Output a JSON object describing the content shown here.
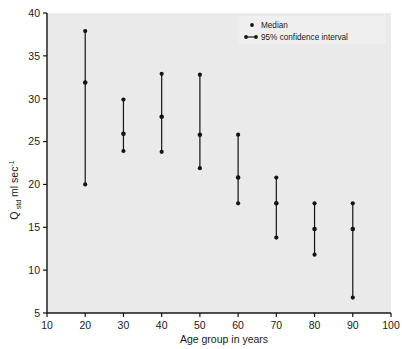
{
  "chart_data": {
    "type": "scatter",
    "title": "",
    "subtitle": "",
    "xlabel": "Age group in years",
    "ylabel": "Q̇std ml sec⁻¹",
    "ylabel_parts": {
      "main": "Q",
      "dot": "˙",
      "subscript": "std",
      "unit": " ml sec",
      "exponent": "-1"
    },
    "xlim": [
      10,
      100
    ],
    "ylim": [
      5,
      40
    ],
    "x_ticks": [
      10,
      20,
      30,
      40,
      50,
      60,
      70,
      80,
      90,
      100
    ],
    "y_ticks": [
      5,
      10,
      15,
      20,
      25,
      30,
      35,
      40
    ],
    "x_tick_labels": [
      "10",
      "20",
      "30",
      "40",
      "50",
      "60",
      "70",
      "80",
      "90",
      "100"
    ],
    "y_tick_labels": [
      "5",
      "10",
      "15",
      "20",
      "25",
      "30",
      "35",
      "40"
    ],
    "grid": false,
    "legend_position": "top-right",
    "legend": [
      {
        "label": "Median",
        "marker": "dot"
      },
      {
        "label": "95% confidence interval",
        "marker": "interval"
      }
    ],
    "categories": [
      20,
      30,
      40,
      50,
      60,
      70,
      80,
      90
    ],
    "series": [
      {
        "name": "Median",
        "values": [
          31.9,
          25.9,
          27.9,
          25.8,
          20.8,
          17.8,
          14.8,
          14.8
        ]
      },
      {
        "name": "Upper 95% CI",
        "values": [
          37.9,
          29.9,
          32.9,
          32.8,
          25.8,
          20.8,
          17.8,
          17.8
        ]
      },
      {
        "name": "Lower 95% CI",
        "values": [
          20.0,
          23.9,
          23.8,
          21.9,
          17.8,
          13.8,
          11.8,
          6.8
        ]
      }
    ],
    "points": [
      {
        "age": 20,
        "lower": 20.0,
        "median": 31.9,
        "upper": 37.9
      },
      {
        "age": 30,
        "lower": 23.9,
        "median": 25.9,
        "upper": 29.9
      },
      {
        "age": 40,
        "lower": 23.8,
        "median": 27.9,
        "upper": 32.9
      },
      {
        "age": 50,
        "lower": 21.9,
        "median": 25.8,
        "upper": 32.8
      },
      {
        "age": 60,
        "lower": 17.8,
        "median": 20.8,
        "upper": 25.8
      },
      {
        "age": 70,
        "lower": 13.8,
        "median": 17.8,
        "upper": 20.8
      },
      {
        "age": 80,
        "lower": 11.8,
        "median": 14.8,
        "upper": 17.8
      },
      {
        "age": 90,
        "lower": 6.8,
        "median": 14.8,
        "upper": 17.8
      }
    ],
    "colors": {
      "plot_background": "#eaeaea",
      "marker": "#141414",
      "line": "#141414",
      "axis": "#141414",
      "text": "#1a1a1a",
      "figure_background": "#ffffff",
      "legend_background": "#eeeeee"
    }
  }
}
